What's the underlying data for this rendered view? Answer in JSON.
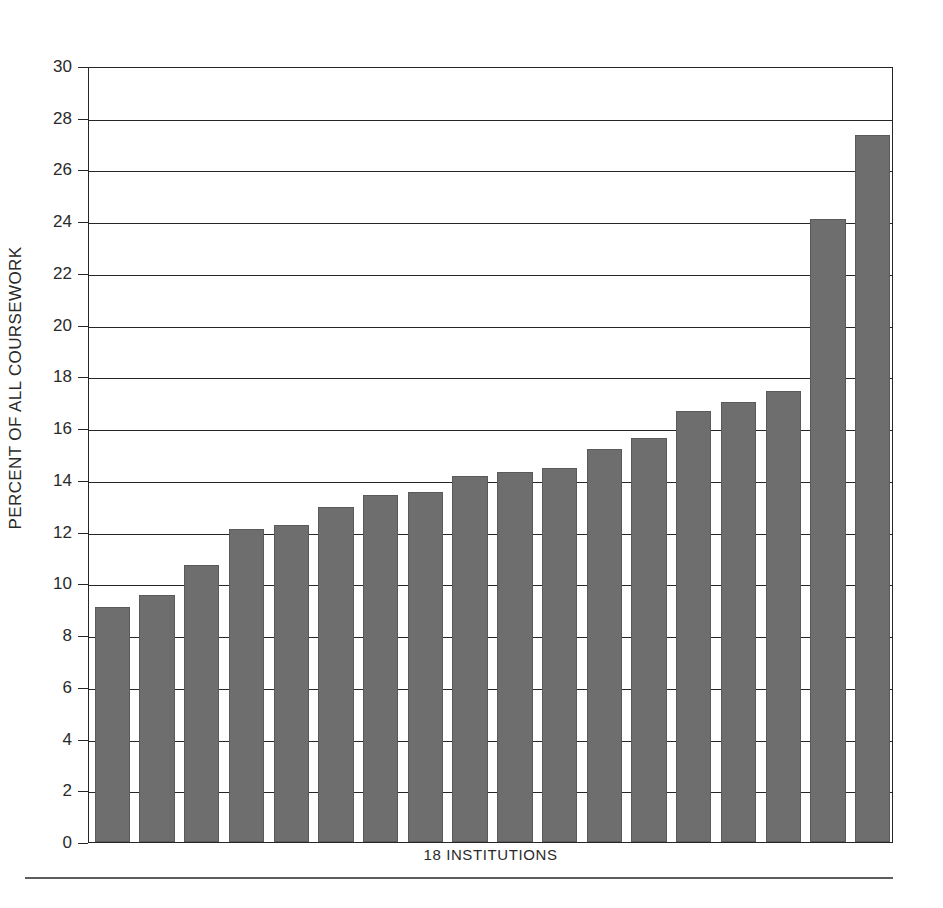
{
  "chart_data": {
    "type": "bar",
    "title": "",
    "subtitle": "",
    "xlabel": "18 INSTITUTIONS",
    "ylabel": "PERCENT OF ALL COURSEWORK",
    "ylim": [
      0,
      30
    ],
    "xlim": [
      0,
      18
    ],
    "y_ticks": [
      0,
      2,
      4,
      6,
      8,
      10,
      12,
      14,
      16,
      18,
      20,
      22,
      24,
      26,
      28,
      30
    ],
    "y_tick_labels": [
      "0",
      "2",
      "4",
      "6",
      "8",
      "10",
      "12",
      "14",
      "16",
      "18",
      "20",
      "22",
      "24",
      "26",
      "28",
      "30"
    ],
    "x_tick_labels": [],
    "grid": "horizontal",
    "legend": null,
    "legend_position": "none",
    "bar_color": "#6e6e6e",
    "frame_color": "#262626",
    "categories": [
      "1",
      "2",
      "3",
      "4",
      "5",
      "6",
      "7",
      "8",
      "9",
      "10",
      "11",
      "12",
      "13",
      "14",
      "15",
      "16",
      "17",
      "18"
    ],
    "values": [
      9.1,
      9.55,
      10.7,
      12.1,
      12.25,
      12.95,
      13.4,
      13.55,
      14.15,
      14.3,
      14.45,
      15.2,
      15.6,
      16.65,
      17.0,
      17.45,
      24.1,
      27.35
    ],
    "series": [
      {
        "name": "Percent of all coursework",
        "values": [
          9.1,
          9.55,
          10.7,
          12.1,
          12.25,
          12.95,
          13.4,
          13.55,
          14.15,
          14.3,
          14.45,
          15.2,
          15.6,
          16.65,
          17.0,
          17.45,
          24.1,
          27.35
        ]
      }
    ],
    "annotations": []
  }
}
